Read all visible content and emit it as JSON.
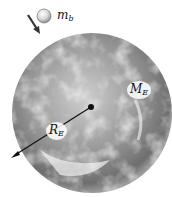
{
  "diagram": {
    "title": "",
    "objects": [
      {
        "name": "ball",
        "label_main": "m",
        "label_sub": "b"
      },
      {
        "name": "earth",
        "label_main": "M",
        "label_sub": "E"
      },
      {
        "name": "radius",
        "label_main": "R",
        "label_sub": "E"
      }
    ],
    "colors": {
      "earth_dark": "#5a5a5a",
      "earth_light": "#e8e8e8",
      "ink": "#111111"
    }
  }
}
